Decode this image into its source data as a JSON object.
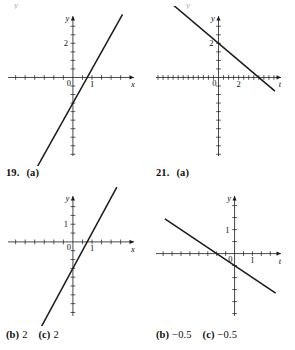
{
  "document": {
    "kind": "textbook-answer-figures",
    "background": "#ffffff",
    "ink_color": "#1a1a1a"
  },
  "cutoff_row": {
    "fragments": [
      {
        "text": "y",
        "x": 14,
        "y": 0
      },
      {
        "text": "y",
        "x": 186,
        "y": 0
      }
    ]
  },
  "captions": [
    {
      "id": "caption-19a",
      "number": "19.",
      "part": "(a)",
      "x": 6,
      "y": 167
    },
    {
      "id": "caption-21a",
      "number": "21.",
      "part": "(a)",
      "x": 156,
      "y": 167
    }
  ],
  "answers": [
    {
      "id": "answer-19bc",
      "x": 6,
      "y": 329,
      "parts": [
        {
          "label": "(b)",
          "value": "2"
        },
        {
          "label": "(c)",
          "value": "2"
        }
      ]
    },
    {
      "id": "answer-21bc",
      "x": 156,
      "y": 329,
      "parts": [
        {
          "label": "(b)",
          "value": "−0.5"
        },
        {
          "label": "(c)",
          "value": "−0.5"
        }
      ]
    }
  ],
  "chart_data": [
    {
      "id": "graph-19a",
      "type": "line",
      "title": "19. (a)",
      "position": {
        "x": 0,
        "y": 6,
        "width": 148,
        "height": 160
      },
      "xlabel": "x",
      "ylabel": "y",
      "origin_label": "0",
      "xlim": [
        -3.4,
        3.2
      ],
      "ylim": [
        -4.6,
        3.6
      ],
      "x_tick_step": 0.5,
      "y_tick_step": 0.5,
      "x_tick_labels": [
        {
          "value": 1,
          "text": "1"
        }
      ],
      "y_tick_labels": [
        {
          "value": 2,
          "text": "2"
        }
      ],
      "grid": false,
      "legend": "none",
      "series": [
        {
          "name": "line-19a",
          "slope": 2,
          "intercept": -1.5,
          "x_from": -2.6,
          "x_to": 2.6,
          "points": [
            [
              -2.6,
              -6.7
            ],
            [
              2.6,
              3.7
            ]
          ]
        }
      ]
    },
    {
      "id": "graph-21a",
      "type": "line",
      "title": "21. (a)",
      "position": {
        "x": 148,
        "y": 6,
        "width": 147,
        "height": 160
      },
      "xlabel": "t",
      "ylabel": "y",
      "origin_label": "0",
      "xlim": [
        -6.2,
        6.2
      ],
      "ylim": [
        -4.6,
        3.6
      ],
      "x_tick_step": 0.5,
      "y_tick_step": 0.5,
      "x_tick_labels": [
        {
          "value": 2,
          "text": "2"
        }
      ],
      "y_tick_labels": [
        {
          "value": 2,
          "text": "2"
        }
      ],
      "grid": false,
      "legend": "none",
      "series": [
        {
          "name": "line-21a",
          "slope": -0.5,
          "intercept": 2,
          "x_from": -5.3,
          "x_to": 5.6,
          "points": [
            [
              -5.3,
              4.65
            ],
            [
              5.6,
              -0.8
            ]
          ]
        }
      ]
    },
    {
      "id": "graph-19bc",
      "type": "line",
      "title": "19. (b) (c)",
      "position": {
        "x": 0,
        "y": 186,
        "width": 148,
        "height": 140
      },
      "xlabel": "x",
      "ylabel": "y",
      "origin_label": "0",
      "xlim": [
        -3.4,
        3.2
      ],
      "ylim": [
        -4.2,
        2.6
      ],
      "x_tick_step": 0.5,
      "y_tick_step": 0.5,
      "x_tick_labels": [
        {
          "value": 1,
          "text": "1"
        }
      ],
      "y_tick_labels": [
        {
          "value": 1,
          "text": "1"
        }
      ],
      "grid": false,
      "legend": "none",
      "series": [
        {
          "name": "line-19bc",
          "slope": 2,
          "intercept": -1.5,
          "x_from": -2.3,
          "x_to": 2.3,
          "points": [
            [
              -2.3,
              -6.1
            ],
            [
              2.3,
              3.1
            ]
          ]
        }
      ]
    },
    {
      "id": "graph-21bc",
      "type": "line",
      "title": "21. (b) (c)",
      "position": {
        "x": 148,
        "y": 186,
        "width": 147,
        "height": 140
      },
      "xlabel": "t",
      "ylabel": "y",
      "origin_label": "0",
      "xlim": [
        -4.4,
        2.6
      ],
      "ylim": [
        -2.6,
        2.4
      ],
      "x_tick_step": 0.5,
      "y_tick_step": 0.5,
      "x_tick_labels": [
        {
          "value": 1,
          "text": "1"
        }
      ],
      "y_tick_labels": [
        {
          "value": 1,
          "text": "1"
        }
      ],
      "grid": false,
      "legend": "none",
      "series": [
        {
          "name": "line-21bc",
          "slope": -0.5,
          "intercept": -0.5,
          "x_from": -3.9,
          "x_to": 2.3,
          "points": [
            [
              -3.9,
              1.45
            ],
            [
              2.3,
              -1.65
            ]
          ]
        }
      ]
    }
  ]
}
